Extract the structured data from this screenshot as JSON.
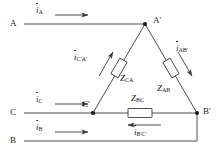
{
  "figure": {
    "type": "delta-connected three-phase circuit diagram",
    "background_color": "#ffffff",
    "line_color": "#3a3a3a",
    "text_color": "#1a1a1a"
  },
  "terminals": [
    {
      "name": "terminal-a",
      "label": "A",
      "x": 10,
      "y": 24
    },
    {
      "name": "terminal-c",
      "label": "C",
      "x": 10,
      "y": 113
    },
    {
      "name": "terminal-b",
      "label": "B",
      "x": 10,
      "y": 141
    },
    {
      "name": "node-a-prime",
      "label": "A'",
      "x": 153,
      "y": 20
    },
    {
      "name": "node-c-prime",
      "label": "C'",
      "x": 82,
      "y": 104
    },
    {
      "name": "node-b-prime",
      "label": "B'",
      "x": 203,
      "y": 110
    }
  ],
  "line_currents": [
    {
      "name": "line-current-a",
      "symbol": "i",
      "subscript": "A",
      "x": 36,
      "y": 10,
      "direction": "right"
    },
    {
      "name": "line-current-c",
      "symbol": "i",
      "subscript": "C",
      "x": 36,
      "y": 99,
      "direction": "right"
    },
    {
      "name": "line-current-b",
      "symbol": "i",
      "subscript": "B",
      "x": 36,
      "y": 127,
      "direction": "right"
    }
  ],
  "phase_currents": [
    {
      "name": "phase-current-ca",
      "symbol": "i",
      "subscript": "C'A'",
      "x": 78,
      "y": 57,
      "direction": "up"
    },
    {
      "name": "phase-current-ab",
      "symbol": "i",
      "subscript": "AB'",
      "x": 176,
      "y": 48,
      "direction": "down"
    },
    {
      "name": "phase-current-bc",
      "symbol": "i",
      "subscript": "B'C'",
      "x": 136,
      "y": 131,
      "direction": "left"
    }
  ],
  "impedances": [
    {
      "name": "impedance-ca",
      "symbol": "Z",
      "subscript": "CA",
      "x": 120,
      "y": 78,
      "orientation": "tilted-left-leg"
    },
    {
      "name": "impedance-ab",
      "symbol": "Z",
      "subscript": "AB",
      "x": 157,
      "y": 88,
      "orientation": "tilted-right-leg"
    },
    {
      "name": "impedance-bc",
      "symbol": "Z",
      "subscript": "BC",
      "x": 131,
      "y": 97,
      "orientation": "horizontal"
    }
  ],
  "geometry": {
    "node_a_prime": {
      "x": 145,
      "y": 24
    },
    "node_c_prime": {
      "x": 93,
      "y": 113
    },
    "node_b_prime": {
      "x": 197,
      "y": 113
    },
    "line_a_start_x": 24,
    "line_c_start_x": 24,
    "line_b_start_x": 24,
    "line_b_y": 141
  }
}
